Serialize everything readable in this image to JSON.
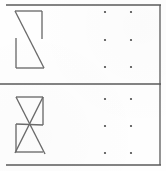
{
  "sheet": {
    "width": 166,
    "height": 171,
    "background_color": "#fefefe",
    "ink_color": "#6b6b6b",
    "rule_color": "#5a5a5a",
    "dot_color": "#4a4a4a",
    "title": "Two-panel figure sheet"
  },
  "borders": {
    "top_rule": {
      "x1": 6,
      "y1": 5,
      "x2": 161,
      "y2": 5
    },
    "middle_rule": {
      "x1": 0,
      "y1": 84,
      "x2": 161,
      "y2": 84
    },
    "bottom_rule": {
      "x1": 6,
      "y1": 165,
      "x2": 161,
      "y2": 165
    },
    "right_rule": {
      "x1": 160,
      "y1": 5,
      "x2": 160,
      "y2": 165
    }
  },
  "panels": [
    {
      "id": "panel-top",
      "figure": {
        "name": "z-shape-figure",
        "description": "Open Z-like polyline: top horizontal bar, right short vertical, long diagonal, left vertical, bottom horizontal",
        "segments": [
          {
            "name": "top-horizontal",
            "x1": 15,
            "y1": 11,
            "x2": 42,
            "y2": 11
          },
          {
            "name": "right-vertical",
            "x1": 42,
            "y1": 11,
            "x2": 42,
            "y2": 39
          },
          {
            "name": "main-diagonal",
            "x1": 15,
            "y1": 11,
            "x2": 44,
            "y2": 68
          },
          {
            "name": "left-vertical",
            "x1": 16,
            "y1": 38,
            "x2": 16,
            "y2": 68
          },
          {
            "name": "bottom-horizontal",
            "x1": 16,
            "y1": 68,
            "x2": 44,
            "y2": 68
          }
        ]
      },
      "dot_grid": {
        "name": "dot-grid-top",
        "rows": 3,
        "cols": 2,
        "x_positions": [
          105,
          131
        ],
        "y_positions": [
          12,
          40,
          67
        ],
        "radius": 1.1
      }
    },
    {
      "id": "panel-bottom",
      "figure": {
        "name": "crossed-parallelogram-figure",
        "description": "Parallelogram outline with two long crossing diagonals forming an X",
        "segments": [
          {
            "name": "top-edge",
            "x1": 16,
            "y1": 97,
            "x2": 43,
            "y2": 97
          },
          {
            "name": "right-vertical",
            "x1": 43,
            "y1": 97,
            "x2": 43,
            "y2": 125
          },
          {
            "name": "left-vertical",
            "x1": 16,
            "y1": 124,
            "x2": 16,
            "y2": 152
          },
          {
            "name": "bottom-edge",
            "x1": 16,
            "y1": 152,
            "x2": 43,
            "y2": 152
          },
          {
            "name": "upper-left-to-lower-right",
            "x1": 16,
            "y1": 97,
            "x2": 45,
            "y2": 154
          },
          {
            "name": "upper-right-to-lower-left",
            "x1": 43,
            "y1": 97,
            "x2": 15,
            "y2": 153
          },
          {
            "name": "left-mid-to-right-mid",
            "x1": 16,
            "y1": 124,
            "x2": 43,
            "y2": 125
          }
        ]
      },
      "dot_grid": {
        "name": "dot-grid-bottom",
        "rows": 3,
        "cols": 2,
        "x_positions": [
          105,
          131
        ],
        "y_positions": [
          99,
          126,
          153
        ],
        "radius": 1.1
      }
    }
  ]
}
